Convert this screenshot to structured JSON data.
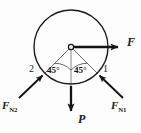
{
  "figure": {
    "type": "free-body-diagram",
    "background_color": "#fdfdfd",
    "stroke_color": "#1a1a1a",
    "body": {
      "shape": "circle",
      "center": {
        "x": 71,
        "y": 47
      },
      "radius": 37,
      "stroke_width": 1.4
    },
    "center_marker": {
      "name": "center-point",
      "x": 71,
      "y": 47,
      "radius": 2.6
    },
    "forces": [
      {
        "id": "F",
        "label": "F",
        "direction": "right",
        "angle_deg": 0,
        "from": {
          "x": 71,
          "y": 47
        },
        "to": {
          "x": 124,
          "y": 47
        },
        "weight": "heavy"
      },
      {
        "id": "P",
        "label": "P",
        "direction": "down",
        "angle_deg": 270,
        "from": {
          "x": 71,
          "y": 47
        },
        "to": {
          "x": 71,
          "y": 117
        },
        "weight": "heavy"
      },
      {
        "id": "FN1",
        "label": "F",
        "subscript": "N1",
        "direction": "up-left",
        "angle_deg": 135,
        "from": {
          "x": 122,
          "y": 97
        },
        "to": {
          "x": 97,
          "y": 73
        },
        "weight": "medium"
      },
      {
        "id": "FN2",
        "label": "F",
        "subscript": "N2",
        "direction": "up-right",
        "angle_deg": 45,
        "from": {
          "x": 20,
          "y": 97
        },
        "to": {
          "x": 45,
          "y": 73
        },
        "weight": "medium"
      }
    ],
    "contact_points": [
      {
        "id": "1",
        "label": "1",
        "x": 97,
        "y": 73
      },
      {
        "id": "2",
        "label": "2",
        "x": 45,
        "y": 73
      }
    ],
    "angles": [
      {
        "id": "left-angle",
        "label": "45°",
        "value": 45,
        "unit": "degrees",
        "between": [
          "radius-to-point-2",
          "vertical-down"
        ]
      },
      {
        "id": "right-angle",
        "label": "45°",
        "value": 45,
        "unit": "degrees",
        "between": [
          "vertical-down",
          "radius-to-point-1"
        ]
      }
    ],
    "construction_lines": [
      {
        "id": "radius-left",
        "from": {
          "x": 71,
          "y": 47
        },
        "to": {
          "x": 45,
          "y": 73
        }
      },
      {
        "id": "radius-right",
        "from": {
          "x": 71,
          "y": 47
        },
        "to": {
          "x": 97,
          "y": 73
        }
      },
      {
        "id": "vertical-axis",
        "from": {
          "x": 71,
          "y": 47
        },
        "to": {
          "x": 71,
          "y": 97
        }
      }
    ],
    "angle_arcs": [
      {
        "id": "arc-left",
        "radius": 23
      },
      {
        "id": "arc-right",
        "radius": 23
      }
    ]
  }
}
